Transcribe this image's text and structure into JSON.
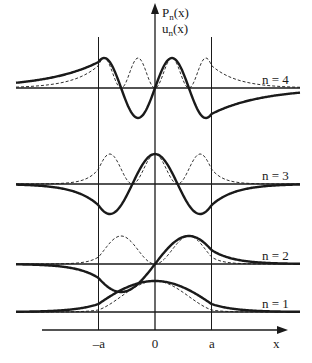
{
  "figure": {
    "title": "",
    "y_axis_label_top": "P",
    "y_axis_label_top_sub": "n",
    "y_axis_label_top_arg": "(x)",
    "y_axis_label_bottom": "u",
    "y_axis_label_bottom_sub": "n",
    "y_axis_label_bottom_arg": "(x)",
    "x_axis_label": "x",
    "x_ticks": [
      {
        "value": -1,
        "label": "–a"
      },
      {
        "value": 0,
        "label": "0"
      },
      {
        "value": 1,
        "label": "a"
      }
    ],
    "x_range": [
      -2.5,
      2.3
    ],
    "well_boundaries": [
      -1,
      1
    ],
    "legend": {
      "solid": "u_n(x) wavefunction",
      "dashed": "P_n(x) probability density"
    },
    "levels": [
      {
        "n": 4,
        "label": "n = 4",
        "parity": "odd",
        "inside_half_periods": 4,
        "decay": 1.1
      },
      {
        "n": 3,
        "label": "n = 3",
        "parity": "even",
        "inside_half_periods": 3,
        "decay": 2.4
      },
      {
        "n": 2,
        "label": "n = 2",
        "parity": "odd",
        "inside_half_periods": 2,
        "decay": 2.6
      },
      {
        "n": 1,
        "label": "n = 1",
        "parity": "even",
        "inside_half_periods": 1,
        "decay": 2.4
      }
    ],
    "colors": {
      "ink": "#1a1a1a",
      "background": "#ffffff"
    }
  }
}
